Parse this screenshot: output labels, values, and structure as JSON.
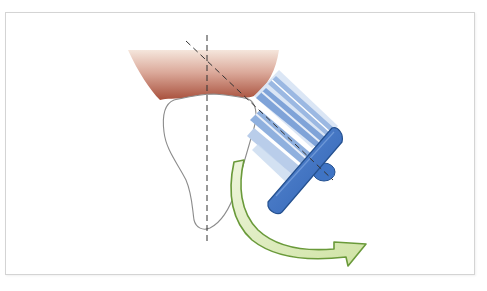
{
  "figure": {
    "elements": {
      "gum": {
        "label": "gingiva",
        "color_top": "#f3e2d8",
        "color_bottom": "#b7644f"
      },
      "tooth": {
        "label": "tooth",
        "fill": "#ffffff",
        "stroke": "#8a8a8a"
      },
      "tooth_axis": {
        "label": "tooth long axis (dashed vertical)"
      },
      "brush_axis": {
        "label": "brush axis (dashed, ~45 degrees)"
      },
      "toothbrush_head": {
        "label": "toothbrush head",
        "color": "#3f74c4",
        "bristle_color": "#7fa3d8"
      },
      "motion_arrow": {
        "label": "rolling motion arrow",
        "fill": "#d9e8b4",
        "stroke": "#6a9a3a"
      }
    },
    "colors": {
      "frame_border": "#d4d4d4",
      "background": "#ffffff",
      "dash": "#333333"
    }
  }
}
